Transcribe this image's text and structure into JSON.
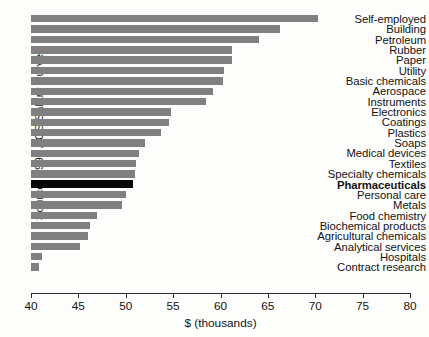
{
  "chart_data": {
    "type": "bar",
    "orientation": "horizontal",
    "title": "",
    "subtitle": "",
    "xlabel": "$ (thousands)",
    "ylabel": "",
    "source_note": "Source: 1998 ACS Salary Survey",
    "xlim": [
      40,
      80
    ],
    "xticks": [
      40,
      45,
      50,
      55,
      60,
      65,
      70,
      75,
      80
    ],
    "xtick_labels": [
      "40",
      "45",
      "50",
      "55",
      "60",
      "65",
      "70",
      "75",
      "80"
    ],
    "grid": false,
    "legend": "none",
    "highlight_category": "Pharmaceuticals",
    "bar_color": "#808080",
    "highlight_color": "#080808",
    "axis_color": "#2b2b2b",
    "categories": [
      "Self-employed",
      "Building",
      "Petroleum",
      "Rubber",
      "Paper",
      "Utility",
      "Basic chemicals",
      "Aerospace",
      "Instruments",
      "Electronics",
      "Coatings",
      "Plastics",
      "Soaps",
      "Medical devices",
      "Textiles",
      "Specialty chemicals",
      "Pharmaceuticals",
      "Personal care",
      "Metals",
      "Food chemistry",
      "Biochemical products",
      "Agricultural chemicals",
      "Analytical services",
      "Hospitals",
      "Contract research"
    ],
    "values": [
      70.3,
      66.3,
      64.1,
      61.2,
      61.2,
      60.4,
      60.3,
      59.2,
      58.5,
      54.8,
      54.6,
      53.7,
      52.0,
      51.4,
      51.1,
      51.0,
      50.8,
      50.0,
      49.6,
      47.0,
      46.2,
      46.0,
      45.2,
      41.2,
      40.8
    ]
  }
}
